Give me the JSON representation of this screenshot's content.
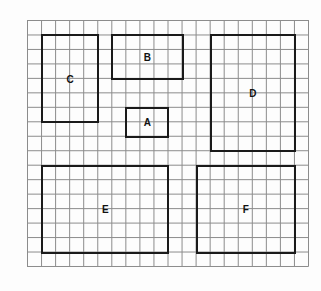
{
  "grid": {
    "origin_x": 27,
    "origin_y": 20,
    "columns": 20,
    "rows": 17,
    "cell_width": 14.05,
    "cell_height": 14.47,
    "line_color": "#8c8c8c",
    "border_color": "#1a1a1a"
  },
  "rectangles": [
    {
      "label": "A",
      "col": 7,
      "row": 6,
      "width": 3,
      "height": 2
    },
    {
      "label": "B",
      "col": 6,
      "row": 1,
      "width": 5,
      "height": 3
    },
    {
      "label": "C",
      "col": 1,
      "row": 1,
      "width": 4,
      "height": 6
    },
    {
      "label": "D",
      "col": 13,
      "row": 1,
      "width": 6,
      "height": 8
    },
    {
      "label": "E",
      "col": 1,
      "row": 10,
      "width": 9,
      "height": 6
    },
    {
      "label": "F",
      "col": 12,
      "row": 10,
      "width": 7,
      "height": 6
    }
  ]
}
